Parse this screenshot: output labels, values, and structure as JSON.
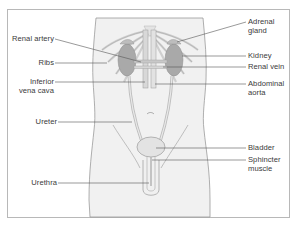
{
  "diagram": {
    "colors": {
      "frame": "#b8b8b8",
      "body_outline": "#9a9a9a",
      "body_fill": "#f1f1f1",
      "organ_fill": "#d0d0d0",
      "kidney_fill": "#a9a9a9",
      "leader_line": "#555555",
      "label_text": "#3a3a3a"
    },
    "labels_left": [
      {
        "id": "renal-artery",
        "lines": [
          "Renal artery"
        ]
      },
      {
        "id": "ribs",
        "lines": [
          "Ribs"
        ]
      },
      {
        "id": "inferior-vena-cava",
        "lines": [
          "Inferior",
          "vena cava"
        ]
      },
      {
        "id": "ureter",
        "lines": [
          "Ureter"
        ]
      },
      {
        "id": "urethra",
        "lines": [
          "Urethra"
        ]
      }
    ],
    "labels_right": [
      {
        "id": "adrenal-gland",
        "lines": [
          "Adrenal",
          "gland"
        ]
      },
      {
        "id": "kidney",
        "lines": [
          "Kidney"
        ]
      },
      {
        "id": "renal-vein",
        "lines": [
          "Renal vein"
        ]
      },
      {
        "id": "abdominal-aorta",
        "lines": [
          "Abdominal",
          "aorta"
        ]
      },
      {
        "id": "bladder",
        "lines": [
          "Bladder"
        ]
      },
      {
        "id": "sphincter-muscle",
        "lines": [
          "Sphincter",
          "muscle"
        ]
      }
    ]
  }
}
